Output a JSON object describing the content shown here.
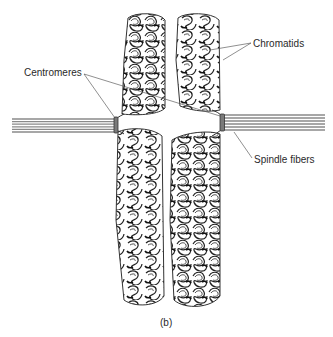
{
  "figure": {
    "panel_label": "(b)",
    "labels": {
      "centromeres": "Centromeres",
      "chromatids": "Chromatids",
      "spindle_fibers": "Spindle fibers"
    }
  },
  "colors": {
    "background": "#ffffff",
    "ink": "#2a2a2a",
    "fiber": "#8a8a8a",
    "centromere": "#6a6a6a"
  },
  "structures": {
    "chromatids": [
      {
        "name": "left-chromatid",
        "x": 122,
        "y_top": 14,
        "y_bottom": 306,
        "width": 44
      },
      {
        "name": "right-chromatid",
        "x": 174,
        "y_top": 14,
        "y_bottom": 308,
        "width": 46
      }
    ],
    "centromeres": [
      {
        "name": "left-centromere",
        "x": 114,
        "y": 117,
        "h": 15
      },
      {
        "name": "right-centromere",
        "x": 220,
        "y": 114,
        "h": 17
      }
    ],
    "spindle_fibers": [
      {
        "side": "left",
        "x1": 12,
        "x2": 115,
        "y": 118,
        "count": 6
      },
      {
        "side": "right",
        "x1": 224,
        "x2": 325,
        "y": 114,
        "count": 6
      }
    ]
  }
}
